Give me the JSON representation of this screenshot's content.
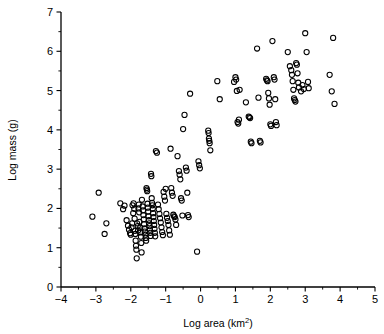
{
  "chart_data": {
    "type": "scatter",
    "title": "",
    "xlabel": "Log area (km2)",
    "xlabel_base": "Log area (km",
    "xlabel_sup": "2",
    "xlabel_tail": ")",
    "ylabel": "Log mass (g)",
    "xlim": [
      -4,
      5
    ],
    "ylim": [
      0,
      7
    ],
    "xticks": [
      -4,
      -3,
      -2,
      -1,
      0,
      1,
      2,
      3,
      4,
      5
    ],
    "xticklabels": [
      "−4",
      "−3",
      "−2",
      "−1",
      "0",
      "1",
      "2",
      "3",
      "4",
      "5"
    ],
    "yticks": [
      0,
      1,
      2,
      3,
      4,
      5,
      6,
      7
    ],
    "yticklabels": [
      "0",
      "1",
      "2",
      "3",
      "4",
      "5",
      "6",
      "7"
    ],
    "minor_tick_step": 0.5,
    "grid": false,
    "legend": false,
    "marker": "open-circle",
    "marker_color": "#000000",
    "marker_radius_px": 2.6,
    "n_points": 191,
    "points": [
      [
        -3.1,
        1.79
      ],
      [
        -2.92,
        2.4
      ],
      [
        -2.7,
        1.62
      ],
      [
        -2.75,
        1.35
      ],
      [
        -2.3,
        2.13
      ],
      [
        -2.22,
        1.98
      ],
      [
        -2.18,
        2.07
      ],
      [
        -2.12,
        1.7
      ],
      [
        -2.08,
        1.56
      ],
      [
        -2.05,
        1.46
      ],
      [
        -2.02,
        1.37
      ],
      [
        -2.0,
        1.33
      ],
      [
        -1.98,
        1.52
      ],
      [
        -1.96,
        1.62
      ],
      [
        -1.95,
        2.08
      ],
      [
        -1.93,
        1.88
      ],
      [
        -1.92,
        2.13
      ],
      [
        -1.9,
        1.99
      ],
      [
        -1.89,
        1.74
      ],
      [
        -1.88,
        1.43
      ],
      [
        -1.87,
        1.35
      ],
      [
        -1.86,
        1.18
      ],
      [
        -1.85,
        1.05
      ],
      [
        -1.84,
        0.95
      ],
      [
        -1.83,
        0.73
      ],
      [
        -1.82,
        1.62
      ],
      [
        -1.8,
        1.55
      ],
      [
        -1.79,
        1.44
      ],
      [
        -1.78,
        2.0
      ],
      [
        -1.77,
        2.1
      ],
      [
        -1.76,
        1.9
      ],
      [
        -1.75,
        1.66
      ],
      [
        -1.73,
        1.51
      ],
      [
        -1.72,
        1.39
      ],
      [
        -1.71,
        1.28
      ],
      [
        -1.7,
        1.12
      ],
      [
        -1.69,
        0.88
      ],
      [
        -1.68,
        2.22
      ],
      [
        -1.66,
        2.05
      ],
      [
        -1.65,
        1.95
      ],
      [
        -1.64,
        1.83
      ],
      [
        -1.63,
        1.72
      ],
      [
        -1.62,
        1.6
      ],
      [
        -1.61,
        1.49
      ],
      [
        -1.6,
        1.41
      ],
      [
        -1.58,
        1.33
      ],
      [
        -1.57,
        1.25
      ],
      [
        -1.56,
        1.18
      ],
      [
        -1.55,
        2.52
      ],
      [
        -1.54,
        2.48
      ],
      [
        -1.53,
        2.44
      ],
      [
        -1.52,
        2.12
      ],
      [
        -1.51,
        2.02
      ],
      [
        -1.5,
        1.92
      ],
      [
        -1.49,
        1.8
      ],
      [
        -1.48,
        1.7
      ],
      [
        -1.47,
        1.62
      ],
      [
        -1.46,
        1.55
      ],
      [
        -1.45,
        1.46
      ],
      [
        -1.44,
        1.38
      ],
      [
        -1.43,
        1.3
      ],
      [
        -1.42,
        2.88
      ],
      [
        -1.41,
        2.82
      ],
      [
        -1.4,
        2.26
      ],
      [
        -1.39,
        2.14
      ],
      [
        -1.38,
        2.08
      ],
      [
        -1.37,
        1.99
      ],
      [
        -1.36,
        1.88
      ],
      [
        -1.35,
        1.78
      ],
      [
        -1.34,
        1.68
      ],
      [
        -1.33,
        1.58
      ],
      [
        -1.32,
        1.48
      ],
      [
        -1.31,
        1.38
      ],
      [
        -1.3,
        1.29
      ],
      [
        -1.28,
        3.46
      ],
      [
        -1.25,
        3.42
      ],
      [
        -1.22,
        2.1
      ],
      [
        -1.2,
        1.98
      ],
      [
        -1.18,
        1.86
      ],
      [
        -1.16,
        1.75
      ],
      [
        -1.14,
        1.64
      ],
      [
        -1.12,
        1.52
      ],
      [
        -1.1,
        1.4
      ],
      [
        -1.08,
        1.32
      ],
      [
        -1.06,
        2.42
      ],
      [
        -1.04,
        2.3
      ],
      [
        -1.02,
        2.2
      ],
      [
        -1.0,
        2.5
      ],
      [
        -0.98,
        1.86
      ],
      [
        -0.96,
        1.76
      ],
      [
        -0.94,
        1.68
      ],
      [
        -0.92,
        1.58
      ],
      [
        -0.9,
        1.44
      ],
      [
        -0.88,
        1.33
      ],
      [
        -0.86,
        3.52
      ],
      [
        -0.84,
        2.52
      ],
      [
        -0.82,
        2.4
      ],
      [
        -0.8,
        2.32
      ],
      [
        -0.78,
        1.84
      ],
      [
        -0.76,
        1.8
      ],
      [
        -0.74,
        1.78
      ],
      [
        -0.72,
        1.72
      ],
      [
        -0.7,
        1.58
      ],
      [
        -0.66,
        3.33
      ],
      [
        -0.62,
        2.95
      ],
      [
        -0.6,
        2.86
      ],
      [
        -0.58,
        2.74
      ],
      [
        -0.56,
        2.26
      ],
      [
        -0.54,
        2.2
      ],
      [
        -0.52,
        1.82
      ],
      [
        -0.5,
        4.02
      ],
      [
        -0.46,
        4.38
      ],
      [
        -0.42,
        3.04
      ],
      [
        -0.4,
        2.96
      ],
      [
        -0.38,
        2.4
      ],
      [
        -0.36,
        1.83
      ],
      [
        -0.34,
        1.78
      ],
      [
        -0.3,
        4.92
      ],
      [
        -0.1,
        0.9
      ],
      [
        -0.06,
        3.2
      ],
      [
        -0.04,
        3.1
      ],
      [
        -0.02,
        3.02
      ],
      [
        0.22,
        3.98
      ],
      [
        0.23,
        3.92
      ],
      [
        0.24,
        3.78
      ],
      [
        0.25,
        3.72
      ],
      [
        0.26,
        3.66
      ],
      [
        0.28,
        3.48
      ],
      [
        0.48,
        5.24
      ],
      [
        0.55,
        4.78
      ],
      [
        0.96,
        5.22
      ],
      [
        1.0,
        5.34
      ],
      [
        1.02,
        5.28
      ],
      [
        1.04,
        4.99
      ],
      [
        1.06,
        4.2
      ],
      [
        1.08,
        4.16
      ],
      [
        1.1,
        4.26
      ],
      [
        1.12,
        5.02
      ],
      [
        1.3,
        4.7
      ],
      [
        1.38,
        4.34
      ],
      [
        1.4,
        4.32
      ],
      [
        1.42,
        4.3
      ],
      [
        1.44,
        3.7
      ],
      [
        1.46,
        3.66
      ],
      [
        1.62,
        6.07
      ],
      [
        1.66,
        4.82
      ],
      [
        1.7,
        3.72
      ],
      [
        1.72,
        3.68
      ],
      [
        1.88,
        5.3
      ],
      [
        1.9,
        5.26
      ],
      [
        1.92,
        5.24
      ],
      [
        1.94,
        4.94
      ],
      [
        1.96,
        4.8
      ],
      [
        1.98,
        4.64
      ],
      [
        2.0,
        4.14
      ],
      [
        2.02,
        4.1
      ],
      [
        2.06,
        6.26
      ],
      [
        2.1,
        5.34
      ],
      [
        2.12,
        5.28
      ],
      [
        2.14,
        4.78
      ],
      [
        2.16,
        4.2
      ],
      [
        2.18,
        4.12
      ],
      [
        2.5,
        5.98
      ],
      [
        2.56,
        5.62
      ],
      [
        2.6,
        5.52
      ],
      [
        2.62,
        5.4
      ],
      [
        2.64,
        5.24
      ],
      [
        2.66,
        5.02
      ],
      [
        2.68,
        4.8
      ],
      [
        2.7,
        4.76
      ],
      [
        2.72,
        4.72
      ],
      [
        2.74,
        5.7
      ],
      [
        2.76,
        5.66
      ],
      [
        2.78,
        5.44
      ],
      [
        2.8,
        5.2
      ],
      [
        2.82,
        5.08
      ],
      [
        2.88,
        4.98
      ],
      [
        2.92,
        5.14
      ],
      [
        2.96,
        5.04
      ],
      [
        3.0,
        6.46
      ],
      [
        3.04,
        5.98
      ],
      [
        3.08,
        5.22
      ],
      [
        3.1,
        5.06
      ],
      [
        3.7,
        5.4
      ],
      [
        3.76,
        4.98
      ],
      [
        3.8,
        6.34
      ],
      [
        3.84,
        4.66
      ]
    ]
  },
  "plot_geometry": {
    "left_px": 61,
    "right_px": 375,
    "top_px": 12,
    "bottom_px": 287
  }
}
